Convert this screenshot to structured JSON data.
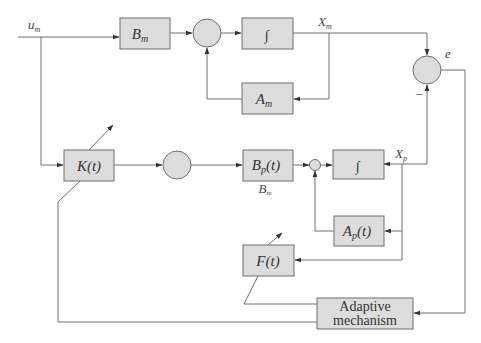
{
  "diagram": {
    "type": "block-diagram",
    "blocks": {
      "bm": {
        "label": "B",
        "sub": "m"
      },
      "int_m": {
        "label": "∫"
      },
      "am": {
        "label": "A",
        "sub": "m"
      },
      "kt": {
        "label": "K(t)"
      },
      "bpt": {
        "label": "B",
        "sub": "p",
        "suffix": "(t)",
        "under_label": "B",
        "under_sub": "m"
      },
      "int_p": {
        "label": "∫"
      },
      "apt": {
        "label": "A",
        "sub": "p",
        "suffix": "(t)"
      },
      "ft": {
        "label": "F(t)"
      },
      "adaptive": {
        "line1": "Adaptive",
        "line2": "mechanism"
      }
    },
    "signals": {
      "um": {
        "label": "u",
        "sub": "m"
      },
      "xm": {
        "label": "X",
        "sub": "m"
      },
      "xp": {
        "label": "X",
        "sub": "p"
      },
      "e": {
        "label": "e"
      },
      "minus": "–"
    }
  }
}
